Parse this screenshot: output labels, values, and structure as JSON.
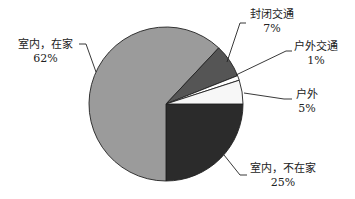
{
  "chart_data": {
    "type": "pie",
    "title": "",
    "categories": [
      "室内，不在家",
      "室内，在家",
      "封闭交通",
      "户外交通",
      "户外"
    ],
    "values": [
      25,
      62,
      7,
      1,
      5
    ],
    "unit": "%",
    "colors": [
      "#2b2b2b",
      "#9b9b9b",
      "#555555",
      "#ffffff",
      "#f7f7f7"
    ],
    "start_angle_deg": 0,
    "direction": "clockwise",
    "legend": "none",
    "labels": [
      {
        "name": "室内，在家",
        "value": "62%"
      },
      {
        "name": "封闭交通",
        "value": "7%"
      },
      {
        "name": "户外交通",
        "value": "1%"
      },
      {
        "name": "户外",
        "value": "5%"
      },
      {
        "name": "室内，不在家",
        "value": "25%"
      }
    ]
  }
}
